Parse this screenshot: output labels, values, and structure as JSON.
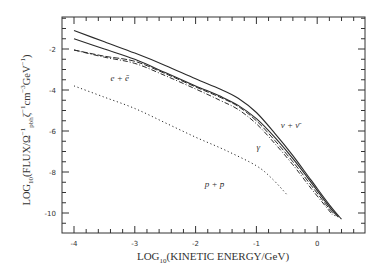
{
  "chart_data": {
    "type": "line",
    "title": "",
    "xlabel": "LOG10(KINETIC ENERGY/GeV)",
    "ylabel": "LOG10(FLUX/Ω^-1_pbh ζ^-1 cm^-3 GeV^-1)",
    "xlim": [
      -4.2,
      0.75
    ],
    "ylim": [
      -11.1,
      -0.45
    ],
    "xticks": [
      -4,
      -3,
      -2,
      -1,
      0
    ],
    "xtick_labels": [
      "-4",
      "-3",
      "-2",
      "-1",
      "0"
    ],
    "yticks": [
      -2,
      -4,
      -6,
      -8,
      -10
    ],
    "ytick_labels": [
      "-2",
      "-4",
      "-6",
      "-8",
      "-10"
    ],
    "grid": false,
    "legend": "inline labels",
    "annotations": [
      {
        "text": "e + ē",
        "x": -3.4,
        "y": -3.4
      },
      {
        "text": "ν + ν̄",
        "x": -0.6,
        "y": -5.7
      },
      {
        "text": "γ",
        "x": -1.0,
        "y": -6.8
      },
      {
        "text": "p + p̄",
        "x": -1.85,
        "y": -8.6
      }
    ],
    "series": [
      {
        "name": "total",
        "style": "solid",
        "x": [
          -4,
          -3.5,
          -3,
          -2.5,
          -2,
          -1.6,
          -1.3,
          -1.0,
          -0.7,
          -0.4,
          -0.1,
          0.2,
          0.4
        ],
        "y": [
          -1.1,
          -1.65,
          -2.2,
          -2.8,
          -3.45,
          -3.95,
          -4.4,
          -5.1,
          -6.1,
          -7.2,
          -8.4,
          -9.6,
          -10.3
        ]
      },
      {
        "name": "ν + ν̄",
        "style": "solid",
        "x": [
          -4,
          -3.5,
          -3,
          -2.5,
          -2,
          -1.6,
          -1.3,
          -1.0,
          -0.7,
          -0.4,
          -0.1,
          0.2,
          0.35
        ],
        "y": [
          -1.5,
          -2.0,
          -2.5,
          -3.15,
          -3.8,
          -4.3,
          -4.75,
          -5.4,
          -6.3,
          -7.35,
          -8.5,
          -9.7,
          -10.2
        ]
      },
      {
        "name": "e + ē",
        "style": "dashed",
        "x": [
          -4,
          -3.5,
          -3,
          -2.5,
          -2,
          -1.6,
          -1.3,
          -1.0,
          -0.7,
          -0.4,
          -0.1,
          0.2,
          0.3
        ],
        "y": [
          -2.05,
          -2.35,
          -2.6,
          -3.2,
          -3.85,
          -4.35,
          -4.8,
          -5.5,
          -6.45,
          -7.5,
          -8.65,
          -9.8,
          -10.15
        ]
      },
      {
        "name": "γ",
        "style": "dashdot",
        "x": [
          -4,
          -3.5,
          -3,
          -2.5,
          -2,
          -1.6,
          -1.3,
          -1.0,
          -0.7,
          -0.4,
          -0.1,
          0.2,
          0.25
        ],
        "y": [
          -2.05,
          -2.4,
          -2.7,
          -3.3,
          -3.95,
          -4.5,
          -4.95,
          -5.65,
          -6.6,
          -7.65,
          -8.8,
          -9.9,
          -10.1
        ]
      },
      {
        "name": "p + p̄",
        "style": "dotted",
        "x": [
          -4,
          -3.5,
          -3,
          -2.5,
          -2,
          -1.5,
          -1.0,
          -0.75,
          -0.5
        ],
        "y": [
          -3.8,
          -4.35,
          -4.9,
          -5.6,
          -6.3,
          -6.95,
          -7.7,
          -8.3,
          -9.1
        ]
      }
    ]
  },
  "labels": {
    "x_axis": "LOG",
    "x_axis_sub": "10",
    "x_axis_rest": "(KINETIC ENERGY/GeV)",
    "y_axis_a": "LOG",
    "y_axis_sub1": "10",
    "y_axis_b": "(FLUX/Ω",
    "y_axis_sup1": "−1",
    "y_axis_sub2": "pbh",
    "y_axis_c": "ζ",
    "y_axis_sup2": "−1",
    "y_axis_d": "cm",
    "y_axis_sup3": "−3",
    "y_axis_e": "GeV",
    "y_axis_sup4": "−1",
    "y_axis_f": ")"
  }
}
